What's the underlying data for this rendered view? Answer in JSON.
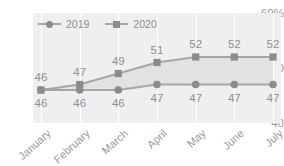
{
  "chart_data": {
    "type": "line",
    "title": "",
    "xlabel": "",
    "ylabel": "",
    "categories": [
      "January",
      "February",
      "March",
      "April",
      "May",
      "June",
      "July"
    ],
    "series": [
      {
        "name": "2019",
        "marker": "circle",
        "label_position": "below",
        "values": [
          46,
          46,
          46,
          47,
          47,
          47,
          47
        ]
      },
      {
        "name": "2020",
        "marker": "square",
        "label_position": "above",
        "values": [
          46,
          47,
          49,
          51,
          52,
          52,
          52
        ]
      }
    ],
    "yticks": [
      "60%",
      "50",
      "40"
    ],
    "ytick_values": [
      60,
      50,
      40
    ],
    "ylim": [
      40,
      60
    ],
    "grid": "vertical",
    "legend_position": "top-left",
    "band_fill": true,
    "colors": {
      "line_2019": "#a6a6a6",
      "line_2020": "#a6a6a6",
      "marker": "#8c8c8c",
      "band": "#e2e2e4",
      "plot_background": "#efeff1",
      "gridline": "#ffffff",
      "text": "#9b9b9b"
    }
  }
}
